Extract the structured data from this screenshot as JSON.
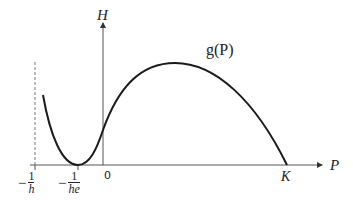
{
  "diagram": {
    "type": "function-graph",
    "axes": {
      "x_label": "P",
      "y_label": "H"
    },
    "curve_label": "g(P)",
    "tick_labels": {
      "neg_one_over_h": {
        "sign": "−",
        "numerator": "1",
        "denominator": "h"
      },
      "neg_one_over_he": {
        "sign": "−",
        "numerator": "1",
        "denominator": "he"
      },
      "origin": "0",
      "K": "K"
    },
    "asymptote": {
      "style": "dashed",
      "at": "−1/h"
    },
    "colors": {
      "stroke": "#1a1a1a",
      "axis": "#555555",
      "dashed": "#777777"
    }
  }
}
